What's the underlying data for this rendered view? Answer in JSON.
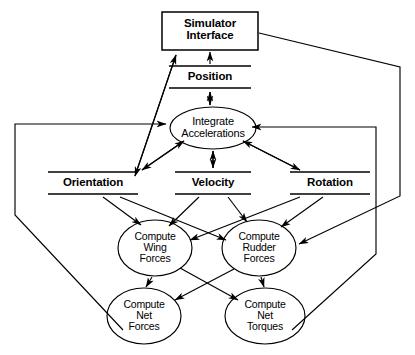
{
  "diagram": {
    "stroke_color": "#000000",
    "background_color": "#ffffff",
    "nodes": [
      {
        "id": "simulator_interface",
        "label": "Simulator\nInterface",
        "shape": "rectangle",
        "cx": 210,
        "cy": 31,
        "w": 96,
        "h": 38
      },
      {
        "id": "position",
        "label": "Position",
        "shape": "data-store",
        "cx": 210,
        "cy": 77,
        "w": 82,
        "h": 22
      },
      {
        "id": "integrate_accelerations",
        "label": "Integrate\nAccelerations",
        "shape": "ellipse",
        "cx": 213,
        "cy": 128,
        "rx": 43,
        "ry": 21
      },
      {
        "id": "orientation",
        "label": "Orientation",
        "shape": "data-store",
        "cx": 93,
        "cy": 183,
        "w": 90,
        "h": 22
      },
      {
        "id": "velocity",
        "label": "Velocity",
        "shape": "data-store",
        "cx": 213,
        "cy": 183,
        "w": 76,
        "h": 22
      },
      {
        "id": "rotation",
        "label": "Rotation",
        "shape": "data-store",
        "cx": 330,
        "cy": 183,
        "w": 80,
        "h": 22
      },
      {
        "id": "compute_wing_forces",
        "label": "Compute\nWing\nForces",
        "shape": "ellipse",
        "cx": 155,
        "cy": 248,
        "rx": 37,
        "ry": 28
      },
      {
        "id": "compute_rudder_forces",
        "label": "Compute\nRudder\nForces",
        "shape": "ellipse",
        "cx": 259,
        "cy": 248,
        "rx": 37,
        "ry": 28
      },
      {
        "id": "compute_net_forces",
        "label": "Compute\nNet\nForces",
        "shape": "ellipse",
        "cx": 144,
        "cy": 316,
        "rx": 37,
        "ry": 28
      },
      {
        "id": "compute_net_torques",
        "label": "Compute\nNet\nTorques",
        "shape": "ellipse",
        "cx": 265,
        "cy": 316,
        "rx": 40,
        "ry": 28
      }
    ],
    "edges": [
      {
        "from": "position",
        "to": "simulator_interface",
        "kind": "arrow-up"
      },
      {
        "from": "integrate_accelerations",
        "to": "position",
        "kind": "double-arrow"
      },
      {
        "from": "orientation",
        "to": "simulator_interface",
        "kind": "double-arrow-diagonal"
      },
      {
        "from": "integrate_accelerations",
        "to": "velocity",
        "kind": "double-arrow"
      },
      {
        "from": "integrate_accelerations",
        "to": "orientation",
        "kind": "double-arrow-diagonal"
      },
      {
        "from": "integrate_accelerations",
        "to": "rotation",
        "kind": "double-arrow-diagonal"
      },
      {
        "from": "orientation",
        "to": "compute_wing_forces",
        "kind": "arrow"
      },
      {
        "from": "orientation",
        "to": "compute_rudder_forces",
        "kind": "arrow"
      },
      {
        "from": "velocity",
        "to": "compute_wing_forces",
        "kind": "arrow"
      },
      {
        "from": "velocity",
        "to": "compute_rudder_forces",
        "kind": "arrow"
      },
      {
        "from": "rotation",
        "to": "compute_wing_forces",
        "kind": "arrow"
      },
      {
        "from": "rotation",
        "to": "compute_rudder_forces",
        "kind": "arrow"
      },
      {
        "from": "compute_wing_forces",
        "to": "compute_net_forces",
        "kind": "arrow"
      },
      {
        "from": "compute_wing_forces",
        "to": "compute_net_torques",
        "kind": "arrow"
      },
      {
        "from": "compute_rudder_forces",
        "to": "compute_net_forces",
        "kind": "arrow"
      },
      {
        "from": "compute_rudder_forces",
        "to": "compute_net_torques",
        "kind": "arrow"
      },
      {
        "from": "compute_net_forces",
        "to": "integrate_accelerations",
        "kind": "feedback-left"
      },
      {
        "from": "compute_net_torques",
        "to": "integrate_accelerations",
        "kind": "feedback-right"
      },
      {
        "from": "simulator_interface",
        "to": "compute_rudder_forces",
        "kind": "control-right"
      }
    ]
  }
}
